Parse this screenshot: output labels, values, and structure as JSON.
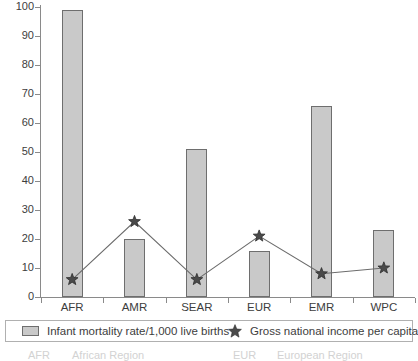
{
  "chart_data": {
    "type": "bar",
    "title": "",
    "subtitle": "",
    "xlabel": "",
    "ylabel": "",
    "ylim": [
      0,
      100
    ],
    "yticks": [
      0,
      10,
      20,
      30,
      40,
      50,
      60,
      70,
      80,
      90,
      100
    ],
    "grid": false,
    "legend_position": "bottom",
    "categories": [
      "AFR",
      "AMR",
      "SEAR",
      "EUR",
      "EMR",
      "WPC"
    ],
    "series": [
      {
        "name": "Infant mortality rate/1,000 live births",
        "type": "bar",
        "marker": "bar-swatch",
        "values": [
          99,
          20,
          51,
          16,
          66,
          23
        ]
      },
      {
        "name": "Gross national income per capita",
        "type": "line",
        "marker": "star",
        "values": [
          6,
          26,
          6,
          21,
          8,
          10
        ]
      }
    ]
  },
  "legend": {
    "bar_label": "Infant mortality rate/1,000 live births",
    "star_label": "Gross national income per capita",
    "bar_swatch_name": "bar-swatch-icon",
    "star_swatch_name": "star-marker-icon"
  },
  "abbreviations": {
    "left": [
      {
        "code": "AFR",
        "name": "African Region"
      }
    ],
    "right": [
      {
        "code": "EUR",
        "name": "European Region"
      }
    ]
  },
  "colors": {
    "bar_fill": "#c9c9c9",
    "bar_stroke": "#6e6e6e",
    "line": "#6b6b6b",
    "marker": "#4a4a4a",
    "axis": "#8a8a8a",
    "text": "#3d3d3d"
  }
}
